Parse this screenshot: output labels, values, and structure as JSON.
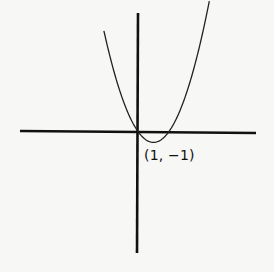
{
  "chart_data": {
    "type": "line",
    "title": "",
    "xlabel": "",
    "ylabel": "",
    "function": "y = x^2 - 2x",
    "series": [
      {
        "name": "parabola",
        "x": [
          -2.2,
          -1.5,
          -1,
          -0.5,
          0,
          0.5,
          1,
          1.5,
          2,
          2.5,
          3,
          3.5,
          4.6
        ],
        "values": [
          9.24,
          5.25,
          3,
          1.25,
          0,
          -0.75,
          -1,
          -0.75,
          0,
          1.25,
          3,
          5.25,
          11.96
        ]
      }
    ],
    "annotations": [
      {
        "x": 1,
        "y": -1,
        "text": "(1, -1)"
      }
    ],
    "axes": {
      "x_axis": true,
      "y_axis": true,
      "ticks": false,
      "grid": false
    },
    "colors": {
      "curve": "#222222",
      "axes": "#111111",
      "background": "#f7f7f5"
    }
  },
  "labels": {
    "vertex": "(1, −1)"
  }
}
